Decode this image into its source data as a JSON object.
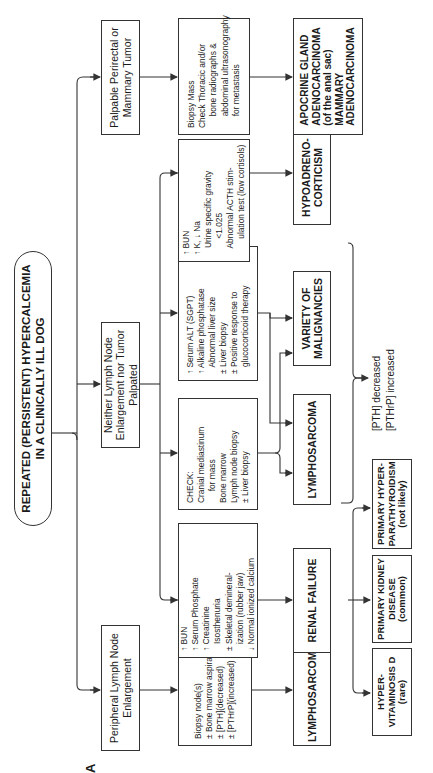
{
  "panel_label": "A",
  "title": "REPEATED (PERSISTENT) HYPERCALCEMIA\nIN A CLINICALLY ILL DOG",
  "branches": {
    "peripheral": "Peripheral Lymph Node\nEnlargement",
    "neither": "Neither Lymph Node\nEnlargement nor Tumor\nPalpated",
    "palpable": "Palpable Perirectal or\nMammary Tumor"
  },
  "tests": {
    "lymph_node_biopsy": "Biopsy node(s)\n± Bone marrow aspirate\n± [PTH](decreased)\n± [PTHrP](increased)",
    "renal": "↑ BUN\n↑ Serum Phosphate\n↑ Creatinine\n   Isosthenuria\n± Skeletal demineral-\n   ization (rubber jaw)\n↓ Normal ionized calcium",
    "check": "CHECK:\nCranial mediastinum\n     for mass\nBone marrow\nLymph node biopsy\n± Liver biopsy",
    "liver": "↑ Serum ALT (SGPT)\n↑ Alkaline phosphatase\n   Abnormal liver size\n± Liver biopsy\n± Positive response to\n   glucocorticoid therapy",
    "adrenal": "↑ BUN\n↑ K, ↓ Na\n   Urine specific gravity\n       <1.025\n   Abnormal ACTH stim-\n       ulation test (low cortisols)",
    "biopsy_mass": "Biopsy Mass\nCheck Thoracic and/or\n     bone radiographs &\n     abdominal ultrasonography\n     for metastasis"
  },
  "diagnoses": {
    "lymphosarcoma_peripheral": "LYMPHOSARCOMA",
    "renal_failure": "RENAL FAILURE",
    "lymphosarcoma_neither": "LYMPHOSARCOMA",
    "variety_malignancies": "VARIETY OF\nMALIGNANCIES",
    "hypoadrenocorticism": "HYPOADRENO-\nCORTICISM",
    "apocrine": "APOCRINE GLAND\nADENOCARCINOMA\n(of the anal sac)\nMAMMARY\nADENOCARCINOMA"
  },
  "renal_causes": {
    "hypervitaminosis": "HYPER-\nVITAMINOSIS D\n(rare)",
    "kidney_disease": "PRIMARY KIDNEY\nDISEASE\n(common)",
    "hyperparathyroidism": "PRIMARY HYPER-\nPARATHYROIDISM\n(not likely)"
  },
  "malignancy_markers": "[PTH] decreased\n[PTHrP] increased",
  "colors": {
    "line": "#333333",
    "background": "#ffffff",
    "text": "#1a1a1a"
  }
}
